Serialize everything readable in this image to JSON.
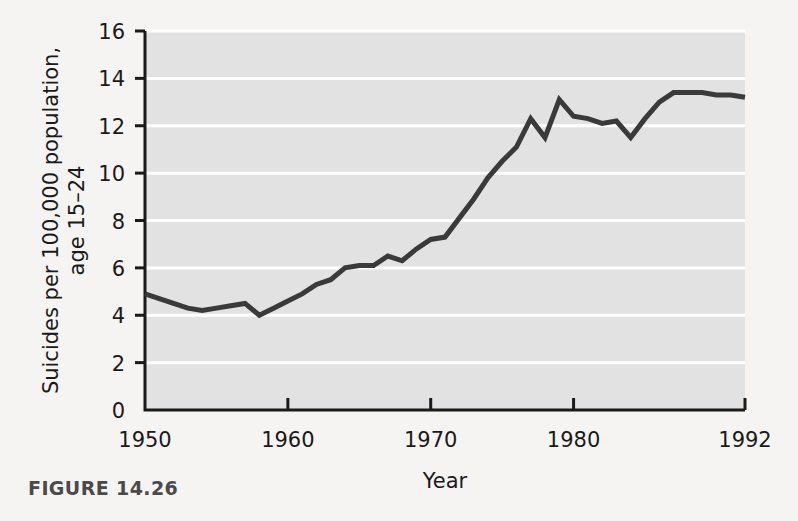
{
  "figure": {
    "caption": "FIGURE 14.26"
  },
  "colors": {
    "page_background": "#f5f4f2",
    "plot_background": "#e2e2e2",
    "gridline": "#ffffff",
    "line": "#3a3a3a",
    "axis": "#1a1a1a",
    "text": "#1a1a1a",
    "caption_text": "#4a4a4a"
  },
  "chart_data": {
    "type": "line",
    "title": "",
    "xlabel": "Year",
    "ylabel": "Suicides per 100,000 population, age 15–24",
    "ylabel_line1": "Suicides per 100,000 population,",
    "ylabel_line2": "age 15–24",
    "xlim": [
      1950,
      1992
    ],
    "ylim": [
      0,
      16
    ],
    "xticks": [
      1950,
      1960,
      1970,
      1980,
      1992
    ],
    "xticklabels": [
      "1950",
      "1960",
      "1970",
      "1980",
      "1992"
    ],
    "yticks": [
      0,
      2,
      4,
      6,
      8,
      10,
      12,
      14,
      16
    ],
    "yticklabels": [
      "0",
      "2",
      "4",
      "6",
      "8",
      "10",
      "12",
      "14",
      "16"
    ],
    "grid": "horizontal",
    "legend": "none",
    "series": [
      {
        "name": "Suicide rate, age 15–24",
        "x": [
          1950,
          1951,
          1952,
          1953,
          1954,
          1955,
          1956,
          1957,
          1958,
          1959,
          1960,
          1961,
          1962,
          1963,
          1964,
          1965,
          1966,
          1967,
          1968,
          1969,
          1970,
          1971,
          1972,
          1973,
          1974,
          1975,
          1976,
          1977,
          1978,
          1979,
          1980,
          1981,
          1982,
          1983,
          1984,
          1985,
          1986,
          1987,
          1988,
          1989,
          1990,
          1991,
          1992
        ],
        "values": [
          4.9,
          4.7,
          4.5,
          4.3,
          4.2,
          4.3,
          4.4,
          4.5,
          4.0,
          4.3,
          4.6,
          4.9,
          5.3,
          5.5,
          6.0,
          6.1,
          6.1,
          6.5,
          6.3,
          6.8,
          7.2,
          7.3,
          8.1,
          8.9,
          9.8,
          10.5,
          11.1,
          12.3,
          11.5,
          13.1,
          12.4,
          12.3,
          12.1,
          12.2,
          11.5,
          12.3,
          13.0,
          13.4,
          13.4,
          13.4,
          13.3,
          13.3,
          13.2
        ]
      }
    ]
  },
  "plot_geometry": {
    "left": 145,
    "right": 745,
    "top": 31,
    "bottom": 410
  }
}
